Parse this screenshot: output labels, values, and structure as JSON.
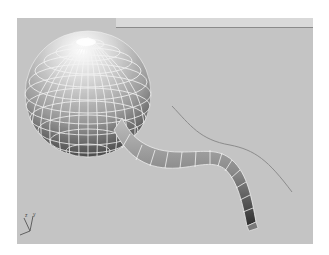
{
  "viewport": {
    "label": "Perspective",
    "background_color": "#c4c4c4",
    "strip_color": "#d9d9d9"
  },
  "scene": {
    "objects": [
      {
        "name": "sphere",
        "type": "geosphere",
        "display": "smooth+highlights with wireframe edges",
        "edge_color": "#f2f2f2"
      },
      {
        "name": "tube",
        "type": "swept-loft",
        "display": "smooth shaded with wireframe edges"
      },
      {
        "name": "path-spline",
        "type": "spline",
        "color": "#8c8c8c"
      }
    ],
    "axis_tripod": {
      "axes": [
        "x",
        "y",
        "z"
      ]
    }
  }
}
